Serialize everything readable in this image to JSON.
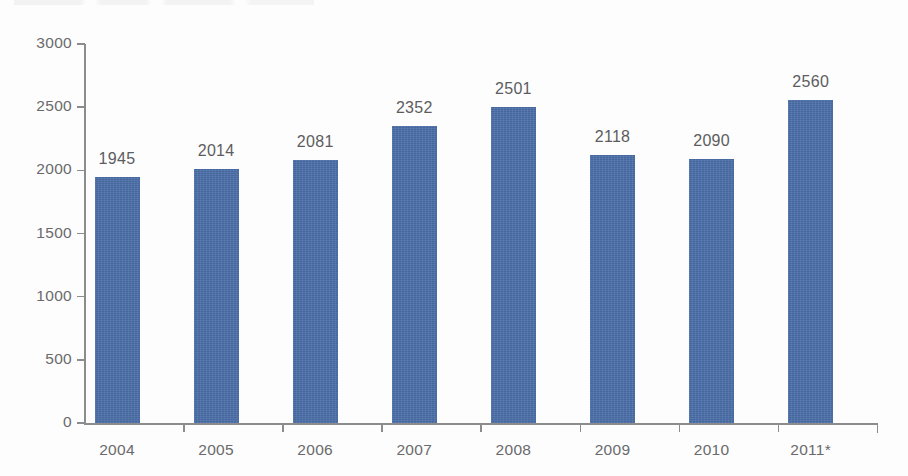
{
  "chart_data": {
    "type": "bar",
    "title": "",
    "subtitle": "",
    "xlabel": "",
    "ylabel": "",
    "categories": [
      "2004",
      "2005",
      "2006",
      "2007",
      "2008",
      "2009",
      "2010",
      "2011*"
    ],
    "values": [
      1945,
      2014,
      2081,
      2352,
      2501,
      2118,
      2090,
      2560
    ],
    "data_labels": [
      "1945",
      "2014",
      "2081",
      "2352",
      "2501",
      "2118",
      "2090",
      "2560"
    ],
    "ylim": [
      0,
      3000
    ],
    "ytick_labels": [
      "0",
      "500",
      "1000",
      "1500",
      "2000",
      "2500",
      "3000"
    ],
    "ytick_values": [
      0,
      500,
      1000,
      1500,
      2000,
      2500,
      3000
    ],
    "grid": false,
    "legend": null,
    "legend_position": "none",
    "series": [
      {
        "name": "",
        "values": [
          1945,
          2014,
          2081,
          2352,
          2501,
          2118,
          2090,
          2560
        ],
        "color": "#4a6ea8"
      }
    ],
    "annotations": {
      "footnote_marker": "*"
    }
  },
  "style": {
    "bar_color": "#4a6ea8",
    "axis_color": "#8c8c8e",
    "label_color": "#6a6a6c",
    "value_label_color": "#5c5c5e",
    "background": "#fdfdfd"
  }
}
